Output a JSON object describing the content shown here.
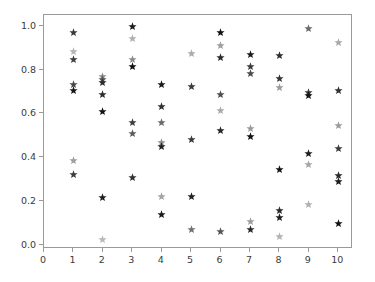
{
  "chart_data": {
    "type": "scatter",
    "title": "",
    "xlabel": "",
    "ylabel": "",
    "xlim": [
      0,
      10.5
    ],
    "ylim": [
      -0.02,
      1.05
    ],
    "grid": false,
    "legend": null,
    "marker": "star",
    "xticks": [
      0,
      1,
      2,
      3,
      4,
      5,
      6,
      7,
      8,
      9,
      10
    ],
    "xtick_labels": [
      "0",
      "1",
      "2",
      "3",
      "4",
      "5",
      "6",
      "7",
      "8",
      "9",
      "10"
    ],
    "yticks": [
      0.0,
      0.2,
      0.4,
      0.6,
      0.8,
      1.0
    ],
    "ytick_labels": [
      "0.0",
      "0.2",
      "0.4",
      "0.6",
      "0.8",
      "1.0"
    ],
    "points": [
      {
        "x": 1,
        "y": 0.972,
        "color": "#3a3a3a"
      },
      {
        "x": 1,
        "y": 0.884,
        "color": "#b4b4b4"
      },
      {
        "x": 1,
        "y": 0.845,
        "color": "#3f3f3f"
      },
      {
        "x": 1,
        "y": 0.733,
        "color": "#484848"
      },
      {
        "x": 1,
        "y": 0.705,
        "color": "#161616"
      },
      {
        "x": 1,
        "y": 0.384,
        "color": "#9e9e9e"
      },
      {
        "x": 1,
        "y": 0.322,
        "color": "#3c3c3c"
      },
      {
        "x": 2,
        "y": 0.768,
        "color": "#8d8d8d"
      },
      {
        "x": 2,
        "y": 0.755,
        "color": "#5a5a5a"
      },
      {
        "x": 2,
        "y": 0.742,
        "color": "#2d2d2d"
      },
      {
        "x": 2,
        "y": 0.688,
        "color": "#2c2c2c"
      },
      {
        "x": 2,
        "y": 0.607,
        "color": "#141414"
      },
      {
        "x": 2,
        "y": 0.217,
        "color": "#1f1f1f"
      },
      {
        "x": 2,
        "y": 0.024,
        "color": "#b8b8b8"
      },
      {
        "x": 3,
        "y": 0.999,
        "color": "#1c1c1c"
      },
      {
        "x": 3,
        "y": 0.944,
        "color": "#b0b0b0"
      },
      {
        "x": 3,
        "y": 0.845,
        "color": "#8a8a8a"
      },
      {
        "x": 3,
        "y": 0.816,
        "color": "#111111"
      },
      {
        "x": 3,
        "y": 0.558,
        "color": "#3e3e3e"
      },
      {
        "x": 3,
        "y": 0.507,
        "color": "#5c5c5c"
      },
      {
        "x": 3,
        "y": 0.306,
        "color": "#303030"
      },
      {
        "x": 4,
        "y": 0.733,
        "color": "#191919"
      },
      {
        "x": 4,
        "y": 0.632,
        "color": "#303030"
      },
      {
        "x": 4,
        "y": 0.557,
        "color": "#6b6b6b"
      },
      {
        "x": 4,
        "y": 0.467,
        "color": "#8f8f8f"
      },
      {
        "x": 4,
        "y": 0.447,
        "color": "#222222"
      },
      {
        "x": 4,
        "y": 0.22,
        "color": "#a3a3a3"
      },
      {
        "x": 4,
        "y": 0.139,
        "color": "#1a1a1a"
      },
      {
        "x": 5,
        "y": 0.874,
        "color": "#ababab"
      },
      {
        "x": 5,
        "y": 0.721,
        "color": "#3a3a3a"
      },
      {
        "x": 5,
        "y": 0.48,
        "color": "#3b3b3b"
      },
      {
        "x": 5,
        "y": 0.219,
        "color": "#212121"
      },
      {
        "x": 5,
        "y": 0.068,
        "color": "#707070"
      },
      {
        "x": 6,
        "y": 0.972,
        "color": "#121212"
      },
      {
        "x": 6,
        "y": 0.909,
        "color": "#9d9d9d"
      },
      {
        "x": 6,
        "y": 0.857,
        "color": "#2a2a2a"
      },
      {
        "x": 6,
        "y": 0.688,
        "color": "#4d4d4d"
      },
      {
        "x": 6,
        "y": 0.612,
        "color": "#aaaaaa"
      },
      {
        "x": 6,
        "y": 0.521,
        "color": "#272727"
      },
      {
        "x": 6,
        "y": 0.058,
        "color": "#555555"
      },
      {
        "x": 7,
        "y": 0.869,
        "color": "#1d1d1d"
      },
      {
        "x": 7,
        "y": 0.815,
        "color": "#3c3c3c"
      },
      {
        "x": 7,
        "y": 0.783,
        "color": "#4a4a4a"
      },
      {
        "x": 7,
        "y": 0.533,
        "color": "#9a9a9a"
      },
      {
        "x": 7,
        "y": 0.496,
        "color": "#131313"
      },
      {
        "x": 7,
        "y": 0.106,
        "color": "#9e9e9e"
      },
      {
        "x": 7,
        "y": 0.07,
        "color": "#2b2b2b"
      },
      {
        "x": 8,
        "y": 0.866,
        "color": "#2e2e2e"
      },
      {
        "x": 8,
        "y": 0.761,
        "color": "#333333"
      },
      {
        "x": 8,
        "y": 0.72,
        "color": "#9b9b9b"
      },
      {
        "x": 8,
        "y": 0.344,
        "color": "#151515"
      },
      {
        "x": 8,
        "y": 0.154,
        "color": "#2a2a2a"
      },
      {
        "x": 8,
        "y": 0.124,
        "color": "#1f1f1f"
      },
      {
        "x": 8,
        "y": 0.038,
        "color": "#b3b3b3"
      },
      {
        "x": 9,
        "y": 0.99,
        "color": "#6a6a6a"
      },
      {
        "x": 9,
        "y": 0.697,
        "color": "#3a3a3a"
      },
      {
        "x": 9,
        "y": 0.68,
        "color": "#151515"
      },
      {
        "x": 9,
        "y": 0.418,
        "color": "#1e1e1e"
      },
      {
        "x": 9,
        "y": 0.366,
        "color": "#a5a5a5"
      },
      {
        "x": 9,
        "y": 0.185,
        "color": "#b0b0b0"
      },
      {
        "x": 10,
        "y": 0.923,
        "color": "#a8a8a8"
      },
      {
        "x": 10,
        "y": 0.703,
        "color": "#303030"
      },
      {
        "x": 10,
        "y": 0.543,
        "color": "#9c9c9c"
      },
      {
        "x": 10,
        "y": 0.44,
        "color": "#3b3b3b"
      },
      {
        "x": 10,
        "y": 0.315,
        "color": "#2a2a2a"
      },
      {
        "x": 10,
        "y": 0.29,
        "color": "#1a1a1a"
      },
      {
        "x": 10,
        "y": 0.097,
        "color": "#141414"
      }
    ]
  }
}
